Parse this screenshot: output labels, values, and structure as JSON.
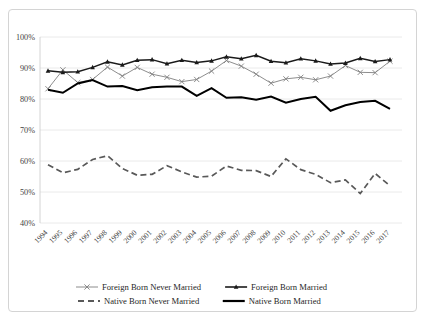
{
  "chart_data": {
    "type": "line",
    "title": "",
    "xlabel": "",
    "ylabel": "",
    "ylim": [
      40,
      100
    ],
    "ytick_labels": [
      "40%",
      "50%",
      "60%",
      "70%",
      "80%",
      "90%",
      "100%"
    ],
    "ytick_values": [
      40,
      50,
      60,
      70,
      80,
      90,
      100
    ],
    "grid": true,
    "legend_position": "bottom",
    "categories": [
      "1994",
      "1995",
      "1996",
      "1997",
      "1998",
      "1999",
      "2000",
      "2001",
      "2002",
      "2003",
      "2004",
      "2005",
      "2006",
      "2007",
      "2008",
      "2009",
      "2010",
      "2011",
      "2012",
      "2013",
      "2014",
      "2015",
      "2016",
      "2017"
    ],
    "series": [
      {
        "name": "Foreign Born Never Married",
        "style": "solid-gray-x-marker",
        "color": "#808080",
        "values": [
          83.3,
          89.4,
          85.3,
          86.3,
          90.3,
          87.4,
          90.2,
          88.0,
          87.0,
          85.6,
          86.3,
          89.0,
          92.4,
          90.6,
          88.0,
          85.1,
          86.5,
          87.0,
          86.2,
          87.4,
          90.8,
          88.6,
          88.5,
          92.2
        ]
      },
      {
        "name": "Foreign Born Married",
        "style": "solid-black-triangle-marker",
        "color": "#1a1a1a",
        "values": [
          89.1,
          88.6,
          88.8,
          90.2,
          92.0,
          91.0,
          92.5,
          92.7,
          91.4,
          92.5,
          91.8,
          92.3,
          93.6,
          93.0,
          94.1,
          92.2,
          91.7,
          93.0,
          92.3,
          91.3,
          91.6,
          93.1,
          92.1,
          92.7
        ]
      },
      {
        "name": "Native Born Never Married",
        "style": "dashed-gray",
        "color": "#595959",
        "values": [
          58.8,
          56.2,
          57.3,
          60.5,
          61.7,
          57.6,
          55.4,
          55.7,
          58.5,
          56.5,
          54.8,
          55.1,
          58.4,
          57.0,
          56.9,
          55.0,
          60.7,
          57.2,
          55.7,
          53.0,
          53.9,
          49.5,
          56.0,
          52.0
        ]
      },
      {
        "name": "Native Born Married",
        "style": "solid-black-thick",
        "color": "#000000",
        "values": [
          83.0,
          82.0,
          85.0,
          86.1,
          84.0,
          84.2,
          82.8,
          83.8,
          84.0,
          84.0,
          81.0,
          83.5,
          80.4,
          80.6,
          79.8,
          80.8,
          78.8,
          80.0,
          80.7,
          76.2,
          78.0,
          79.0,
          79.4,
          76.8
        ]
      }
    ],
    "legend": [
      {
        "label": "Foreign Born Never Married",
        "style": "solid-gray-x-marker",
        "color": "#808080"
      },
      {
        "label": "Foreign Born Married",
        "style": "solid-black-triangle-marker",
        "color": "#1a1a1a"
      },
      {
        "label": "Native Born Never Married",
        "style": "dashed-gray",
        "color": "#595959"
      },
      {
        "label": "Native Born Married",
        "style": "solid-black-thick",
        "color": "#000000"
      }
    ]
  }
}
